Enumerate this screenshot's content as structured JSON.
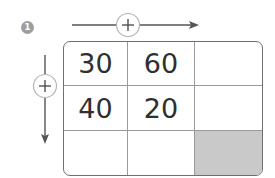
{
  "problem": {
    "number": "1",
    "badge_color": "#9e9e9e"
  },
  "operations": {
    "horizontal": {
      "symbol": "+",
      "direction": "right"
    },
    "vertical": {
      "symbol": "+",
      "direction": "down"
    }
  },
  "grid": {
    "rows": [
      [
        "30",
        "60",
        ""
      ],
      [
        "40",
        "20",
        ""
      ],
      [
        "",
        "",
        ""
      ]
    ],
    "shaded_cell": {
      "row": 2,
      "col": 2,
      "color": "#c9c9c9"
    }
  }
}
